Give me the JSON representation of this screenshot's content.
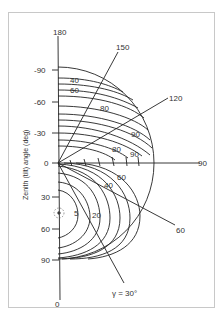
{
  "figure": {
    "axis_title": "Zenith (tilt) angle (deg)",
    "vertical_axis_ticks": [
      "-90",
      "-60",
      "-30",
      "0",
      "30",
      "60",
      "90"
    ],
    "vertical_axis_top_label": "180",
    "vertical_axis_bottom_label": "0",
    "radial_labels": [
      "150",
      "120",
      "90",
      "60"
    ],
    "gamma_label": "γ = 30°",
    "contour_labels_upper": [
      "40",
      "60",
      "80",
      "90",
      "80",
      "90"
    ],
    "contour_labels_lower": [
      "5",
      "20",
      "40",
      "60"
    ],
    "sun_symbol": "sun-icon"
  },
  "colors": {
    "line": "#222222",
    "text": "#333333",
    "frame": "#c8c8c8"
  }
}
